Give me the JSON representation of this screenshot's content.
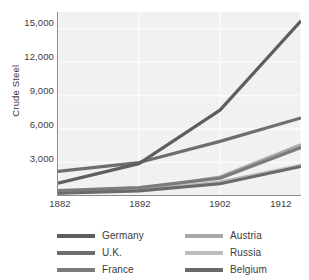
{
  "chart_data": {
    "type": "line",
    "title": "",
    "xlabel": "",
    "ylabel": "Crude Steel",
    "x": [
      1882,
      1892,
      1902,
      1912
    ],
    "categories": [
      "1882",
      "1892",
      "1902",
      "1912"
    ],
    "xtick_labels": [
      "1882",
      "1892",
      "1902",
      "1912"
    ],
    "ytick_labels": [
      "3,000",
      "6,000",
      "9,000",
      "12,000",
      "15,000"
    ],
    "ytick_values": [
      3000,
      6000,
      9000,
      12000,
      15000
    ],
    "xlim": [
      1882,
      1912
    ],
    "ylim": [
      0,
      16500
    ],
    "grid": true,
    "grid_color": "#fbfbfb",
    "plot_background": "#f1f1f1",
    "legend_position": "bottom",
    "legend_columns": 2,
    "series": [
      {
        "name": "Germany",
        "color": "#5e5e5e",
        "values": [
          1150,
          2900,
          7700,
          15700
        ]
      },
      {
        "name": "U.K.",
        "color": "#6e6e6e",
        "values": [
          2200,
          3000,
          4900,
          7000
        ]
      },
      {
        "name": "France",
        "color": "#7b7b7b",
        "values": [
          480,
          760,
          1600,
          4350
        ]
      },
      {
        "name": "Austria",
        "color": "#a8a8a8",
        "values": [
          320,
          600,
          1700,
          4600
        ]
      },
      {
        "name": "Russia",
        "color": "#bcbcbc",
        "values": [
          280,
          520,
          1250,
          2750
        ]
      },
      {
        "name": "Belgium",
        "color": "#6a6a6a",
        "values": [
          250,
          460,
          1100,
          2650
        ]
      }
    ]
  },
  "axis": {
    "y_title": "Crude Steel",
    "y_ticks": [
      {
        "label": "15,000"
      },
      {
        "label": "12,000"
      },
      {
        "label": "9,000"
      },
      {
        "label": "6,000"
      },
      {
        "label": "3,000"
      }
    ],
    "x_ticks": [
      {
        "label": "1882"
      },
      {
        "label": "1892"
      },
      {
        "label": "1902"
      },
      {
        "label": "1912"
      }
    ]
  },
  "legend": {
    "left_column": [
      {
        "label": "Germany",
        "color": "#5e5e5e"
      },
      {
        "label": "U.K.",
        "color": "#6e6e6e"
      },
      {
        "label": "France",
        "color": "#7b7b7b"
      }
    ],
    "right_column": [
      {
        "label": "Austria",
        "color": "#a8a8a8"
      },
      {
        "label": "Russia",
        "color": "#bcbcbc"
      },
      {
        "label": "Belgium",
        "color": "#6a6a6a"
      }
    ]
  }
}
